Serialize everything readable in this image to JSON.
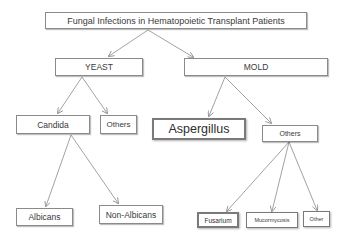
{
  "diagram": {
    "title": "Fungal Infections in Hematopoietic Transplant  Patients",
    "nodes": {
      "yeast": "YEAST",
      "mold": "MOLD",
      "candida": "Candida",
      "yeast_others": "Others",
      "aspergillus": "Aspergillus",
      "mold_others": "Others",
      "albicans": "Albicans",
      "non_albicans": "Non-Albicans",
      "fusarium": "Fusarium",
      "mucormycosis": "Mucormycosis",
      "other": "Other"
    },
    "edges": [
      [
        "title",
        "yeast"
      ],
      [
        "title",
        "mold"
      ],
      [
        "yeast",
        "candida"
      ],
      [
        "yeast",
        "yeast_others"
      ],
      [
        "mold",
        "aspergillus"
      ],
      [
        "mold",
        "mold_others"
      ],
      [
        "candida",
        "albicans"
      ],
      [
        "candida",
        "non_albicans"
      ],
      [
        "mold_others",
        "fusarium"
      ],
      [
        "mold_others",
        "mucormycosis"
      ],
      [
        "mold_others",
        "other"
      ]
    ],
    "colors": {
      "border": "#8a8a8a",
      "text": "#3a3a3a",
      "background": "#ffffff"
    }
  }
}
